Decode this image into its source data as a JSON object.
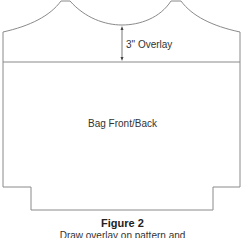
{
  "diagram": {
    "overlay_label": "3\" Overlay",
    "piece_label": "Bag Front/Back",
    "figure_title": "Figure 2",
    "figure_caption": "Draw overlay on pattern and",
    "line_color": "#8a8a8a"
  }
}
